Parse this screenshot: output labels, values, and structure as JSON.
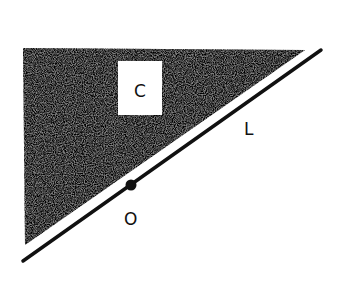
{
  "diagram": {
    "labels": {
      "region": "C",
      "line": "L",
      "point": "O"
    },
    "colors": {
      "background": "#ffffff",
      "shade": "#1a1a1a",
      "ink": "#111111"
    }
  }
}
